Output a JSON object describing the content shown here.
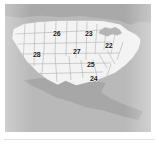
{
  "figure": {
    "kind": "map",
    "projection_area": "United States with state boundaries, Canada to the north, Mexico and Central America to the south"
  },
  "colors": {
    "page_background": "#ffffff",
    "ocean": "#b9b9b9",
    "canada_land": "#a9a9a9",
    "mexico_land": "#a7a7a7",
    "usa_land": "#f3f3f3",
    "state_border": "#b0b0b0",
    "label_text": "#1a1a1a",
    "bottom_rule": "#e2e2e2"
  },
  "map": {
    "landmasses": [
      {
        "name": "canada",
        "label": "Canada"
      },
      {
        "name": "usa",
        "label": "United States"
      },
      {
        "name": "mexico",
        "label": "Mexico and Central America"
      }
    ],
    "water_features": [
      {
        "name": "great-lakes",
        "label": "Great Lakes"
      }
    ],
    "labels": [
      {
        "id": "label-26",
        "value": "26",
        "x": 48,
        "y": 26,
        "region_hint": "northern plains / Montana"
      },
      {
        "id": "label-23",
        "value": "23",
        "x": 80,
        "y": 26,
        "region_hint": "upper midwest / Minnesota"
      },
      {
        "id": "label-22",
        "value": "22",
        "x": 100,
        "y": 38,
        "region_hint": "great lakes / Michigan"
      },
      {
        "id": "label-28",
        "value": "28",
        "x": 28,
        "y": 47,
        "region_hint": "far west / California - Nevada"
      },
      {
        "id": "label-27",
        "value": "27",
        "x": 68,
        "y": 44,
        "region_hint": "central plains / Nebraska - Kansas"
      },
      {
        "id": "label-25",
        "value": "25",
        "x": 82,
        "y": 57,
        "region_hint": "mid south / Missouri - Tennessee"
      },
      {
        "id": "label-24",
        "value": "24",
        "x": 85,
        "y": 71,
        "region_hint": "gulf coast / Louisiana - Mississippi"
      }
    ]
  }
}
